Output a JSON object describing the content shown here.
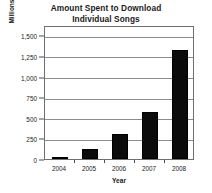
{
  "chart_data": {
    "type": "bar",
    "title": "Amount Spent to Download Individual Songs",
    "title_lines": [
      "Amount Spent to Download",
      "Individual Songs"
    ],
    "xlabel": "Year",
    "ylabel": "Millions of Dollars",
    "categories": [
      "2004",
      "2005",
      "2006",
      "2007",
      "2008"
    ],
    "values": [
      20,
      120,
      305,
      565,
      1320
    ],
    "ylim": [
      0,
      1625
    ],
    "ytick_values": [
      0,
      250,
      500,
      750,
      1000,
      1250,
      1500
    ],
    "ytick_labels": [
      "0",
      "250",
      "500",
      "750",
      "1,000",
      "1,250",
      "1,500"
    ],
    "grid": true,
    "grid_axis": "y",
    "legend": false,
    "bar_color": "#0b0b0b",
    "frame_color": "#6f6f6f",
    "gridline_color": "#8c8c8c",
    "text_color": "#1a1a1a"
  }
}
